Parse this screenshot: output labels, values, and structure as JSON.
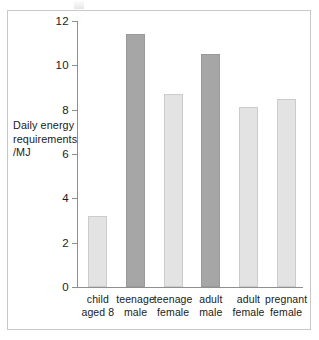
{
  "chart_data": {
    "type": "bar",
    "title": "",
    "xlabel": "",
    "ylabel": "Daily energy requirements /MJ",
    "ylabel_lines": [
      "Daily energy",
      "requirements",
      "/MJ"
    ],
    "categories": [
      "child aged 8",
      "teenage male",
      "teenage female",
      "adult male",
      "adult female",
      "pregnant female"
    ],
    "category_lines": [
      [
        "child",
        "aged 8"
      ],
      [
        "teenage",
        "male"
      ],
      [
        "teenage",
        "female"
      ],
      [
        "adult",
        "male"
      ],
      [
        "adult",
        "female"
      ],
      [
        "pregnant",
        "female"
      ]
    ],
    "values": [
      3.2,
      11.4,
      8.7,
      10.5,
      8.1,
      8.5
    ],
    "bar_shades": [
      "light",
      "dark",
      "light",
      "dark",
      "light",
      "light"
    ],
    "ylim": [
      0,
      12
    ],
    "yticks": [
      0,
      2,
      4,
      6,
      8,
      10,
      12
    ],
    "ytick_labels": [
      "0",
      "2",
      "4",
      "6",
      "8",
      "10",
      "12"
    ],
    "grid": false,
    "legend": false,
    "colors": {
      "bar_light": "#e3e3e3",
      "bar_light_border": "#cccccc",
      "bar_dark": "#a6a6a6",
      "bar_dark_border": "#9a9a9a",
      "axis": "#8f8f8f",
      "frame": "#c9c9c9",
      "text": "#1a1a1a",
      "background": "#ffffff"
    }
  }
}
